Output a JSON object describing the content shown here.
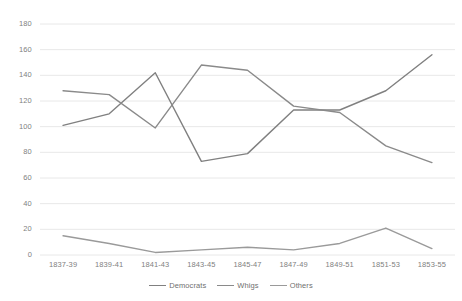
{
  "chart_data": {
    "type": "line",
    "title": "",
    "xlabel": "",
    "ylabel": "",
    "ylim": [
      0,
      180
    ],
    "ytick_step": 20,
    "grid": true,
    "legend_position": "bottom",
    "categories": [
      "1837-39",
      "1839-41",
      "1841-43",
      "1843-45",
      "1845-47",
      "1847-49",
      "1849-51",
      "1851-53",
      "1853-55"
    ],
    "yticks": [
      "0",
      "20",
      "40",
      "60",
      "80",
      "100",
      "120",
      "140",
      "160",
      "180"
    ],
    "series": [
      {
        "name": "Democrats",
        "color": "#808080",
        "values": [
          101,
          110,
          142,
          73,
          79,
          113,
          113,
          128,
          156
        ]
      },
      {
        "name": "Whigs",
        "color": "#8a8a8a",
        "values": [
          128,
          125,
          99,
          148,
          144,
          116,
          111,
          85,
          72
        ]
      },
      {
        "name": "Others",
        "color": "#9a9a9a",
        "values": [
          15,
          9,
          2,
          4,
          6,
          4,
          9,
          21,
          5
        ]
      }
    ]
  },
  "legend": {
    "items": [
      {
        "label": "Democrats"
      },
      {
        "label": "Whigs"
      },
      {
        "label": "Others"
      }
    ]
  },
  "colors": {
    "grid": "#e8e8e8",
    "tick_text": "#7f7f7f",
    "plot_background": "#ffffff"
  }
}
